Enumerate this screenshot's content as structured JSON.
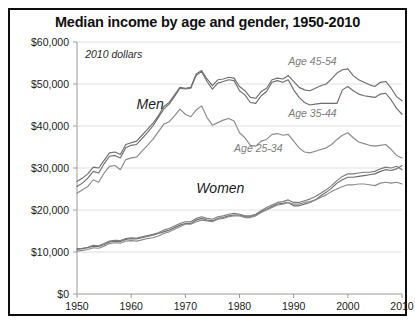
{
  "chart_data": {
    "type": "line",
    "title": "Median income by age and gender, 1950-2010",
    "subtitle": "2010 dollars",
    "xlabel": "",
    "ylabel": "",
    "xlim": [
      1950,
      2010
    ],
    "ylim": [
      0,
      60000
    ],
    "grid": true,
    "legend_position": "inline-annotations",
    "x_ticks": [
      "1950",
      "1960",
      "1970",
      "1980",
      "1990",
      "2000",
      "2010"
    ],
    "y_ticks": [
      "$0",
      "$10,000",
      "$20,000",
      "$30,000",
      "$40,000",
      "$50,000",
      "$60,000"
    ],
    "x_tick_values": [
      1950,
      1960,
      1970,
      1980,
      1990,
      2000,
      2010
    ],
    "y_tick_values": [
      0,
      10000,
      20000,
      30000,
      40000,
      50000,
      60000
    ],
    "annotations": [
      {
        "text": "2010 dollars",
        "x": 1951.5,
        "y": 57000,
        "style": "italic"
      },
      {
        "text": "Men",
        "x": 1961,
        "y": 45500,
        "style": "italic-large"
      },
      {
        "text": "Women",
        "x": 1972,
        "y": 25500,
        "style": "italic-large"
      },
      {
        "text": "Age 45-54",
        "x": 1989,
        "y": 55200,
        "style": "italic-grey"
      },
      {
        "text": "Age 35-44",
        "x": 1989,
        "y": 42800,
        "style": "italic-grey"
      },
      {
        "text": "Age 25-34",
        "x": 1979,
        "y": 34600,
        "style": "italic-grey"
      }
    ],
    "x": [
      1950,
      1951,
      1952,
      1953,
      1954,
      1955,
      1956,
      1957,
      1958,
      1959,
      1960,
      1961,
      1962,
      1963,
      1964,
      1965,
      1966,
      1967,
      1968,
      1969,
      1970,
      1971,
      1972,
      1973,
      1974,
      1975,
      1976,
      1977,
      1978,
      1979,
      1980,
      1981,
      1982,
      1983,
      1984,
      1985,
      1986,
      1987,
      1988,
      1989,
      1990,
      1991,
      1992,
      1993,
      1994,
      1995,
      1996,
      1997,
      1998,
      1999,
      2000,
      2001,
      2002,
      2003,
      2004,
      2005,
      2006,
      2007,
      2008,
      2009,
      2010
    ],
    "series": [
      {
        "name": "Men, Age 45-54",
        "color": "#6e6e6e",
        "values": [
          26800,
          27600,
          28600,
          30200,
          30000,
          31800,
          33600,
          33800,
          33200,
          35600,
          36000,
          36400,
          37800,
          39200,
          40600,
          42400,
          44600,
          45600,
          47400,
          49200,
          49000,
          49200,
          52400,
          53200,
          51200,
          49600,
          51000,
          51200,
          51600,
          51400,
          49400,
          48400,
          46800,
          46600,
          48200,
          49000,
          51000,
          51400,
          51200,
          52000,
          50600,
          49200,
          48600,
          48400,
          49000,
          49600,
          50000,
          51200,
          52600,
          53400,
          53600,
          52000,
          51000,
          50400,
          49800,
          49400,
          50400,
          50600,
          49000,
          47000,
          46000
        ]
      },
      {
        "name": "Men, Age 35-44",
        "color": "#6e6e6e",
        "values": [
          25600,
          26400,
          27600,
          29200,
          28800,
          31000,
          32800,
          33000,
          32400,
          34800,
          35400,
          35600,
          37000,
          38400,
          40000,
          42000,
          44000,
          45200,
          47000,
          49000,
          48800,
          49000,
          52000,
          53000,
          50600,
          48800,
          50200,
          50600,
          51000,
          50800,
          48400,
          47400,
          45600,
          45400,
          47200,
          48200,
          50400,
          50800,
          50400,
          51000,
          48600,
          46800,
          45600,
          45000,
          45200,
          45400,
          45400,
          45400,
          45400,
          48600,
          49400,
          48400,
          47600,
          47200,
          47000,
          46800,
          47600,
          47800,
          46200,
          44200,
          42800
        ]
      },
      {
        "name": "Men, Age 25-34",
        "color": "#8a8a8a",
        "values": [
          24000,
          24800,
          25600,
          27200,
          26600,
          28800,
          30400,
          30600,
          29600,
          32000,
          32400,
          32600,
          34000,
          35400,
          36800,
          38600,
          40400,
          41000,
          42400,
          44000,
          42800,
          42200,
          43800,
          44800,
          42000,
          40200,
          40800,
          41400,
          41800,
          41200,
          38400,
          37200,
          35400,
          35200,
          36400,
          36800,
          38000,
          38200,
          37800,
          38000,
          36400,
          34800,
          33800,
          33600,
          34000,
          34400,
          34800,
          35600,
          36800,
          37800,
          38400,
          37200,
          36200,
          35800,
          35400,
          35200,
          35400,
          35600,
          34400,
          33000,
          32400
        ]
      },
      {
        "name": "Women, Age 45-54",
        "color": "#6e6e6e",
        "values": [
          10600,
          10800,
          11000,
          11400,
          11300,
          11800,
          12400,
          12600,
          12500,
          13000,
          13200,
          13100,
          13400,
          13700,
          14000,
          14400,
          14800,
          15200,
          15800,
          16400,
          16800,
          16800,
          17600,
          18000,
          17600,
          17400,
          18000,
          18200,
          18600,
          18800,
          18800,
          18400,
          18400,
          18800,
          19600,
          20200,
          20800,
          21400,
          21600,
          21800,
          21000,
          21000,
          21400,
          21800,
          22400,
          23400,
          24200,
          25200,
          26400,
          27200,
          27800,
          27800,
          28000,
          28200,
          28400,
          28600,
          29200,
          29600,
          29400,
          29800,
          30600
        ]
      },
      {
        "name": "Women, Age 35-44",
        "color": "#7c7c7c",
        "values": [
          10800,
          10900,
          11100,
          11600,
          11500,
          12000,
          12600,
          12800,
          12700,
          13200,
          13400,
          13300,
          13600,
          13900,
          14200,
          14600,
          15200,
          15600,
          16200,
          16800,
          17200,
          17200,
          18000,
          18400,
          18000,
          17800,
          18400,
          18600,
          19000,
          19200,
          19000,
          18600,
          18600,
          19000,
          19800,
          20600,
          21200,
          21800,
          22000,
          22400,
          21800,
          21800,
          22200,
          22600,
          23200,
          24000,
          24800,
          25800,
          27000,
          28000,
          28600,
          28600,
          28800,
          29000,
          29000,
          29200,
          29800,
          30200,
          30000,
          30400,
          29600
        ]
      },
      {
        "name": "Women, Age 25-34",
        "color": "#8a8a8a",
        "values": [
          10200,
          10400,
          10600,
          11000,
          10900,
          11400,
          12000,
          12200,
          12100,
          12600,
          12700,
          12600,
          12900,
          13200,
          13400,
          13800,
          14400,
          14800,
          15400,
          16000,
          16600,
          16600,
          17200,
          17600,
          17400,
          17200,
          17800,
          18000,
          18400,
          18600,
          18600,
          18200,
          18200,
          18600,
          19400,
          20000,
          20600,
          21200,
          21400,
          21800,
          21400,
          21400,
          21800,
          22000,
          22400,
          23000,
          23600,
          24400,
          25000,
          25600,
          26000,
          26000,
          26200,
          26200,
          26000,
          25800,
          26400,
          26600,
          26400,
          26600,
          26200
        ]
      }
    ]
  },
  "footer": {
    "note": ""
  }
}
